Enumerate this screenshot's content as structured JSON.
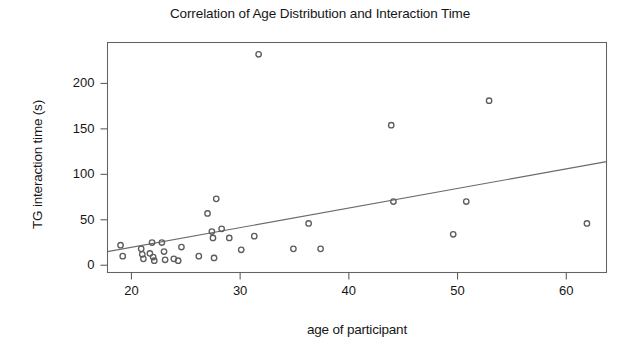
{
  "chart_data": {
    "type": "scatter",
    "title": "Correlation of Age Distribution and Interaction Time",
    "xlabel": "age of participant",
    "ylabel": "TG interaction time (s)",
    "xlim": [
      17.8,
      63.7
    ],
    "ylim": [
      -8,
      245
    ],
    "xticks": [
      20,
      30,
      40,
      50,
      60
    ],
    "xtick_labels": [
      "20",
      "30",
      "40",
      "50",
      "60"
    ],
    "yticks": [
      0,
      50,
      100,
      150,
      200
    ],
    "ytick_labels": [
      "0",
      "50",
      "100",
      "150",
      "200"
    ],
    "grid": false,
    "legend": null,
    "marker": "open-circle",
    "marker_color": "#5d5d5d",
    "line_color": "#6b6b6b",
    "frame_color": "#636363",
    "points": [
      {
        "x": 19.0,
        "y": 22
      },
      {
        "x": 19.2,
        "y": 10
      },
      {
        "x": 20.9,
        "y": 18
      },
      {
        "x": 21.0,
        "y": 12
      },
      {
        "x": 21.1,
        "y": 7
      },
      {
        "x": 21.7,
        "y": 13
      },
      {
        "x": 21.9,
        "y": 25
      },
      {
        "x": 22.0,
        "y": 9
      },
      {
        "x": 22.1,
        "y": 5
      },
      {
        "x": 22.8,
        "y": 25
      },
      {
        "x": 23.0,
        "y": 15
      },
      {
        "x": 23.1,
        "y": 6
      },
      {
        "x": 23.9,
        "y": 7
      },
      {
        "x": 24.3,
        "y": 5
      },
      {
        "x": 24.6,
        "y": 20
      },
      {
        "x": 26.2,
        "y": 10
      },
      {
        "x": 27.0,
        "y": 57
      },
      {
        "x": 27.4,
        "y": 37
      },
      {
        "x": 27.5,
        "y": 30
      },
      {
        "x": 27.6,
        "y": 8
      },
      {
        "x": 27.8,
        "y": 73
      },
      {
        "x": 28.3,
        "y": 40
      },
      {
        "x": 29.0,
        "y": 30
      },
      {
        "x": 30.1,
        "y": 17
      },
      {
        "x": 31.3,
        "y": 32
      },
      {
        "x": 31.7,
        "y": 232
      },
      {
        "x": 34.9,
        "y": 18
      },
      {
        "x": 36.3,
        "y": 46
      },
      {
        "x": 37.4,
        "y": 18
      },
      {
        "x": 43.9,
        "y": 154
      },
      {
        "x": 44.1,
        "y": 70
      },
      {
        "x": 49.6,
        "y": 34
      },
      {
        "x": 50.8,
        "y": 70
      },
      {
        "x": 52.9,
        "y": 181
      },
      {
        "x": 61.9,
        "y": 46
      }
    ],
    "fit_line": {
      "x_start": 17.8,
      "y_start": 15,
      "x_end": 63.7,
      "y_end": 114
    }
  },
  "figure": {
    "background": "#ffffff"
  }
}
